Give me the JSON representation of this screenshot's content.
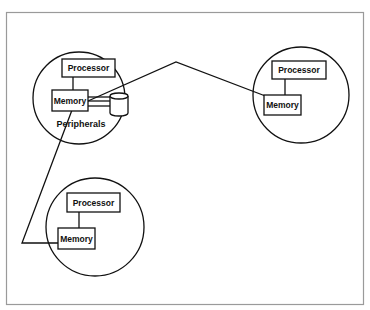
{
  "diagram": {
    "title": "",
    "nodes": [
      {
        "id": "node-top-left",
        "processor_label": "Processor",
        "memory_label": "Memory",
        "peripherals_label": "Peripherals",
        "has_peripheral": true
      },
      {
        "id": "node-right",
        "processor_label": "Processor",
        "memory_label": "Memory",
        "has_peripheral": false
      },
      {
        "id": "node-bottom-left",
        "processor_label": "Processor",
        "memory_label": "Memory",
        "has_peripheral": false
      }
    ],
    "connections": [
      {
        "from": "node-top-left.memory",
        "to": "node-right.memory"
      },
      {
        "from": "node-top-left.memory",
        "to": "node-bottom-left.memory"
      },
      {
        "from": "node-top-left.memory",
        "to": "node-top-left.peripheral"
      }
    ],
    "colors": {
      "stroke": "#111111",
      "frame": "#9a9a9a",
      "background": "#ffffff"
    }
  }
}
